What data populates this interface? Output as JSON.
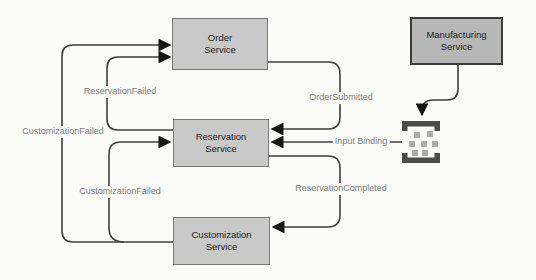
{
  "colors": {
    "bg": "#fbfbfa",
    "line": "#3f3f3f",
    "arrow": "#161616",
    "node-fill": "#c9c9c9",
    "node-border": "#7a7a7a",
    "node-text": "#1c1c1c",
    "mfg-fill": "#b7b7b7",
    "mfg-border": "#3c3c3c",
    "edge-label": "#7d7d7d",
    "icon-bracket": "#4a4a4a",
    "icon-square": "#ababab"
  },
  "nodes": {
    "order": {
      "line1": "Order",
      "line2": "Service"
    },
    "reservation": {
      "line1": "Reservation",
      "line2": "Service"
    },
    "customization": {
      "line1": "Customization",
      "line2": "Service"
    },
    "manufacturing": {
      "line1": "Manufacturing",
      "line2": "Service"
    }
  },
  "edges": {
    "reservation_failed": "ReservationFailed",
    "customization_failed_to_order": "CustomizationFailed",
    "customization_failed_to_reservation": "CustomizationFailed",
    "order_submitted": "OrderSubmitted",
    "input_binding": "Input Binding",
    "reservation_completed": "ReservationCompleted"
  },
  "icons": {
    "input_binding": "input-binding-icon"
  }
}
